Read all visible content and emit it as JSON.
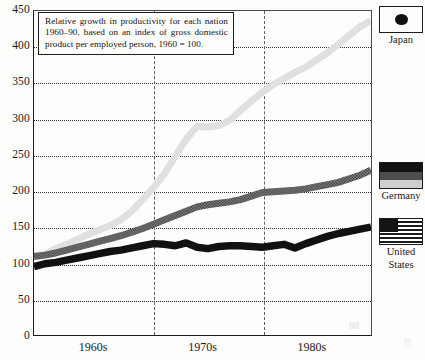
{
  "caption": {
    "text": "Relative growth in productivity for each nation 1960–90, based on an index of gross domestic product per employed person, 1960 = 100."
  },
  "legend": {
    "position": "right",
    "entries": [
      {
        "label": "Japan",
        "icon": "japan-flag-icon",
        "color": "#d8d8d8"
      },
      {
        "label": "Germany",
        "icon": "germany-flag-icon",
        "color": "#6f6f6f"
      },
      {
        "label": "United States",
        "label_line1": "United",
        "label_line2": "States",
        "icon": "united-states-flag-icon",
        "color": "#111111"
      }
    ]
  },
  "chart_data": {
    "type": "line",
    "title": "",
    "subtitle": "",
    "xlabel": "",
    "ylabel": "",
    "ylim": [
      0,
      450
    ],
    "yticks": [
      0,
      50,
      100,
      150,
      200,
      250,
      300,
      350,
      400,
      450
    ],
    "ytick_labels": [
      "0",
      "50",
      "100",
      "150",
      "200",
      "250",
      "300",
      "350",
      "400",
      "450"
    ],
    "xlim": [
      1959,
      1990
    ],
    "xtick_labels": [
      "1960s",
      "1970s",
      "1980s"
    ],
    "xtick_positions": [
      1964.5,
      1974.5,
      1984.5
    ],
    "decade_dividers": [
      1970,
      1980
    ],
    "grid": "horizontal-dotted",
    "index_base": 100,
    "index_base_year": 1960,
    "x": [
      1959,
      1960,
      1961,
      1962,
      1963,
      1964,
      1965,
      1966,
      1967,
      1968,
      1969,
      1970,
      1971,
      1972,
      1973,
      1974,
      1975,
      1976,
      1977,
      1978,
      1979,
      1980,
      1981,
      1982,
      1983,
      1984,
      1985,
      1986,
      1987,
      1988,
      1989,
      1990
    ],
    "series": [
      {
        "name": "Japan",
        "color": "#d8d8d8",
        "values": [
          110,
          112,
          120,
          126,
          133,
          140,
          146,
          152,
          160,
          172,
          188,
          205,
          224,
          248,
          272,
          290,
          289,
          291,
          298,
          312,
          325,
          337,
          348,
          356,
          365,
          372,
          382,
          392,
          404,
          416,
          428,
          437
        ]
      },
      {
        "name": "Germany",
        "color": "#6f6f6f",
        "values": [
          109,
          111,
          114,
          118,
          122,
          126,
          130,
          134,
          138,
          143,
          148,
          154,
          160,
          166,
          172,
          178,
          181,
          183,
          185,
          188,
          193,
          198,
          199,
          200,
          201,
          203,
          206,
          209,
          212,
          217,
          222,
          229
        ]
      },
      {
        "name": "United States",
        "color": "#111111",
        "values": [
          95,
          99,
          101,
          104,
          107,
          110,
          113,
          116,
          118,
          121,
          124,
          127,
          126,
          124,
          128,
          122,
          120,
          123,
          124,
          124,
          123,
          122,
          124,
          126,
          121,
          127,
          132,
          137,
          141,
          144,
          147,
          150
        ]
      }
    ]
  }
}
